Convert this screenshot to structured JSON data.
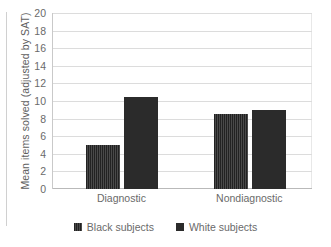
{
  "chart_data": {
    "type": "bar",
    "title": "",
    "xlabel": "",
    "ylabel": "Mean items solved (adjusted by SAT)",
    "categories": [
      "Diagnostic",
      "Nondiagnostic"
    ],
    "series": [
      {
        "name": "Black subjects",
        "values": [
          5.0,
          8.5
        ],
        "color": "#2f2f2f",
        "fill": "hatched"
      },
      {
        "name": "White subjects",
        "values": [
          10.5,
          9.0
        ],
        "color": "#2b2b2b",
        "fill": "solid"
      }
    ],
    "ylim": [
      0,
      20
    ],
    "ytick_step": 2,
    "yticks": [
      20,
      18,
      16,
      14,
      12,
      10,
      8,
      6,
      4,
      2,
      0
    ],
    "grid": true,
    "legend_position": "bottom"
  },
  "axis": {
    "y_title": "Mean items solved (adjusted by SAT)",
    "tick_labels": [
      "20",
      "18",
      "16",
      "14",
      "12",
      "10",
      "8",
      "6",
      "4",
      "2",
      "0"
    ]
  },
  "categories": [
    {
      "label": "Diagnostic"
    },
    {
      "label": "Nondiagnostic"
    }
  ],
  "legend": {
    "items": [
      {
        "label": "Black subjects",
        "swatch": "legend-swatch-black-subjects"
      },
      {
        "label": "White subjects",
        "swatch": "legend-swatch-white-subjects"
      }
    ]
  },
  "colors": {
    "bar_black_subjects": "#2f2f2f",
    "bar_white_subjects": "#2b2b2b",
    "gridline": "#dcdcdc",
    "axis": "#c9c9c9",
    "text": "#6a6a6a",
    "background": "#ffffff"
  }
}
